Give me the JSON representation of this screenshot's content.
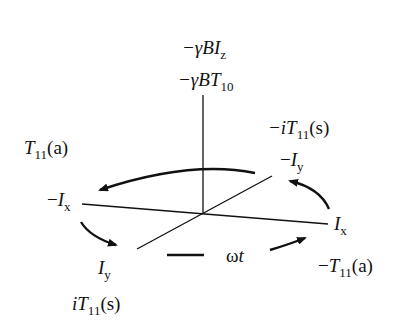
{
  "diagram": {
    "type": "rotating-frame-axes",
    "axes": {
      "z_top_labels": [
        "−γBI_z",
        "−γBT_10"
      ],
      "x_positive": "I_x",
      "x_negative": "−I_x",
      "y_positive": "I_y",
      "y_negative": "−I_y"
    },
    "labels": {
      "z1": {
        "prefix": "−γB",
        "var": "I",
        "sub": "z"
      },
      "z2": {
        "prefix": "−γB",
        "var": "T",
        "sub": "10"
      },
      "neg_iT11s": {
        "prefix": "−i",
        "var": "T",
        "sub": "11",
        "suffix": "(s)"
      },
      "neg_Iy": {
        "prefix": "−",
        "var": "I",
        "sub": "y"
      },
      "T11a": {
        "prefix": "",
        "var": "T",
        "sub": "11",
        "suffix": "(a)"
      },
      "neg_Ix": {
        "prefix": "−",
        "var": "I",
        "sub": "x"
      },
      "Ix": {
        "prefix": "",
        "var": "I",
        "sub": "x"
      },
      "Iy": {
        "prefix": "",
        "var": "I",
        "sub": "y"
      },
      "omega_t": {
        "prefix": "ω",
        "var": "t"
      },
      "neg_T11a": {
        "prefix": "−",
        "var": "T",
        "sub": "11",
        "suffix": "(a)"
      },
      "iT11s": {
        "prefix": "i",
        "var": "T",
        "sub": "11",
        "suffix": "(s)"
      }
    },
    "rotation_label": "ωt",
    "rotation_direction": "counterclockwise (viewed from above)",
    "colors": {
      "line": "#111111",
      "background": "#ffffff"
    }
  }
}
